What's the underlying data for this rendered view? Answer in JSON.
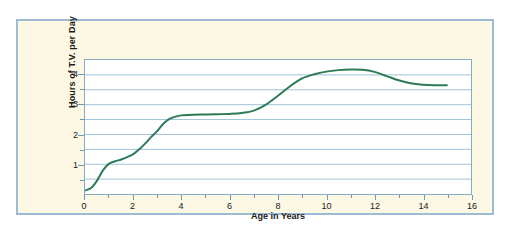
{
  "figure": {
    "background_color": "#ffffff",
    "panel_background_color": "#fdf8e4",
    "panel_border_color": "#9dbcd4",
    "plot_background_color": "#ffffff",
    "plot_border_color": "#88abc4",
    "gridline_color": "#9fc2d8",
    "line_color": "#2d7a57",
    "text_color": "#1a1a1a"
  },
  "chart_data": {
    "type": "line",
    "title": "",
    "xlabel": "Age in Years",
    "ylabel": "Hours of T.V. per Day",
    "xlim": [
      0,
      16
    ],
    "ylim": [
      0,
      4.5
    ],
    "xticks": [
      0,
      2,
      4,
      6,
      8,
      10,
      12,
      14,
      16
    ],
    "xtick_labels": [
      "0",
      "2",
      "4",
      "6",
      "8",
      "10",
      "12",
      "14",
      "16"
    ],
    "xminor_ticks": [
      1,
      3,
      5,
      7,
      9,
      11,
      13,
      15
    ],
    "yticks": [
      1,
      2,
      3,
      4
    ],
    "ytick_labels": [
      "1",
      "2",
      "3",
      "4"
    ],
    "yminor_ticks": [
      0.5,
      1.5,
      2.5,
      3.5
    ],
    "grid": true,
    "grid_axis": "y",
    "gridlines_y": [
      0.5,
      1.0,
      1.5,
      2.0,
      2.5,
      3.0,
      3.5,
      4.0
    ],
    "legend": false,
    "series": [
      {
        "name": "Hours of T.V. per Day",
        "color": "#2d7a57",
        "line_width": 2,
        "x": [
          0.0,
          0.25,
          0.5,
          0.75,
          1.0,
          1.25,
          1.5,
          1.75,
          2.0,
          2.25,
          2.5,
          2.75,
          3.0,
          3.25,
          3.5,
          3.75,
          4.0,
          4.5,
          5.0,
          5.5,
          6.0,
          6.5,
          7.0,
          7.5,
          8.0,
          8.5,
          9.0,
          9.5,
          10.0,
          10.5,
          11.0,
          11.5,
          12.0,
          12.5,
          13.0,
          13.5,
          14.0,
          14.5,
          15.0
        ],
        "y": [
          0.12,
          0.2,
          0.45,
          0.8,
          1.02,
          1.1,
          1.16,
          1.24,
          1.34,
          1.5,
          1.7,
          1.92,
          2.12,
          2.36,
          2.52,
          2.6,
          2.64,
          2.66,
          2.67,
          2.68,
          2.69,
          2.72,
          2.8,
          3.0,
          3.3,
          3.62,
          3.88,
          4.02,
          4.11,
          4.16,
          4.18,
          4.17,
          4.1,
          3.96,
          3.82,
          3.72,
          3.67,
          3.65,
          3.65
        ]
      }
    ],
    "annotations": []
  }
}
